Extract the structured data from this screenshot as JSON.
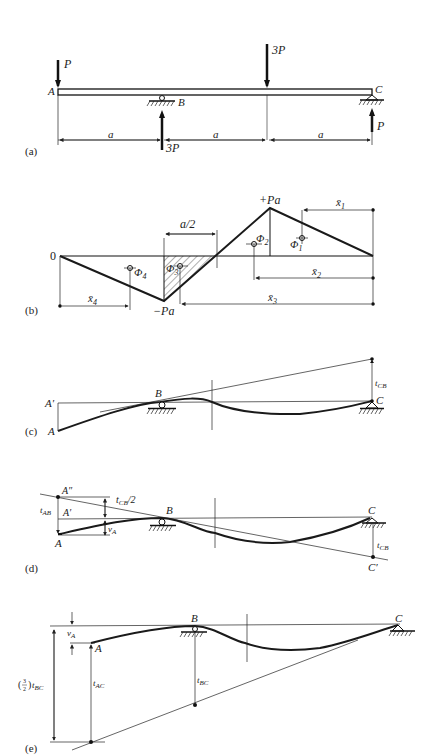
{
  "figure": {
    "panels": [
      {
        "id": "a",
        "label": "(a)",
        "title": "Beam loading"
      },
      {
        "id": "b",
        "label": "(b)",
        "title": "Moment diagram"
      },
      {
        "id": "c",
        "label": "(c)",
        "title": "Deflected shape with tangent at B"
      },
      {
        "id": "d",
        "label": "(d)",
        "title": "Tangent deviations"
      },
      {
        "id": "e",
        "label": "(e)",
        "title": "Tangent at C"
      }
    ]
  },
  "panel_a": {
    "label": "(a)",
    "loads": {
      "A": "P",
      "mid": "3P",
      "B_reaction": "3P",
      "C_reaction": "P"
    },
    "points": {
      "A": "A",
      "B": "B",
      "C": "C"
    },
    "spans": [
      "a",
      "a",
      "a"
    ]
  },
  "panel_b": {
    "label": "(b)",
    "zero": "0",
    "max": "+Pa",
    "min": "−Pa",
    "half": "a/2",
    "areas": [
      "Φ",
      "Φ",
      "Φ",
      "Φ"
    ],
    "area_subs": [
      "1",
      "2",
      "3",
      "4"
    ],
    "xbars": [
      "x̄",
      "x̄",
      "x̄",
      "x̄"
    ],
    "xbar_subs": [
      "1",
      "2",
      "3",
      "4"
    ]
  },
  "panel_c": {
    "label": "(c)",
    "points": {
      "A": "A",
      "A_prime": "A′",
      "B": "B",
      "C": "C"
    },
    "t": "t",
    "t_sub": "CB"
  },
  "panel_d": {
    "label": "(d)",
    "points": {
      "A": "A",
      "A_prime": "A′",
      "A_dprime": "A″",
      "B": "B",
      "C": "C",
      "C_prime": "C′"
    },
    "tAB": "t",
    "tAB_sub": "AB",
    "tCB_half": "t",
    "tCB_half_sub": "CB",
    "tCB_half_suffix": "/2",
    "vA": "v",
    "vA_sub": "A",
    "tCB": "t",
    "tCB_sub": "CB"
  },
  "panel_e": {
    "label": "(e)",
    "points": {
      "A": "A",
      "B": "B",
      "C": "C"
    },
    "vA": "v",
    "vA_sub": "A",
    "tAC": "t",
    "tAC_sub": "AC",
    "tBC": "t",
    "tBC_sub": "BC",
    "ratio_prefix": "(½)t",
    "ratio_sub": "BC",
    "ratio_num": "3",
    "ratio_den": "2"
  }
}
